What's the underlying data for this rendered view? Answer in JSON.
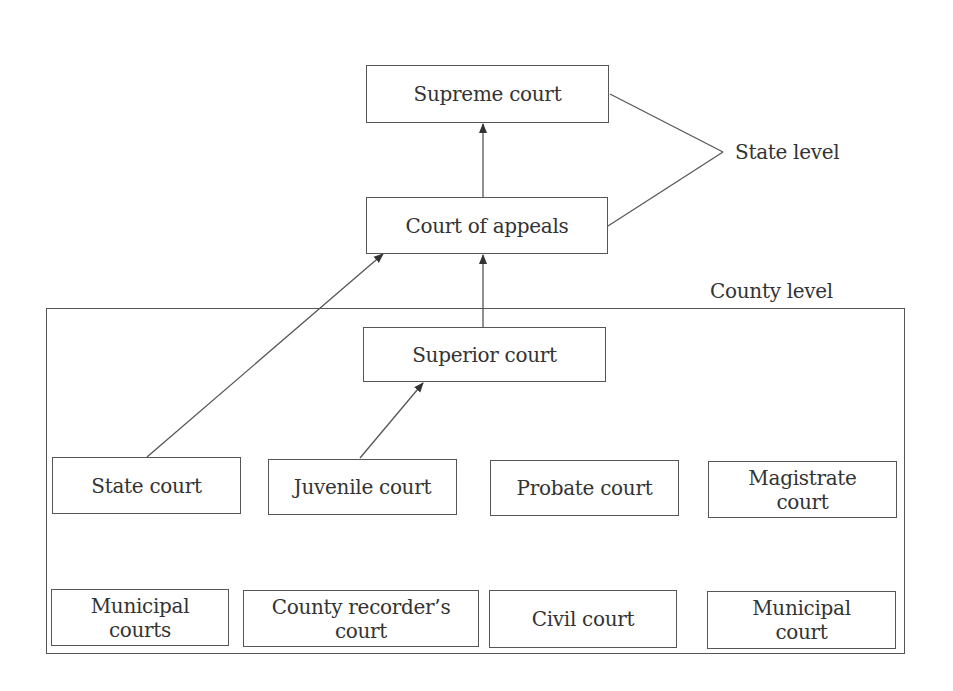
{
  "diagram": {
    "state_level_label": "State level",
    "county_level_label": "County level",
    "state_courts": {
      "supreme": "Supreme court",
      "appeals": "Court of appeals"
    },
    "county_courts": {
      "superior": "Superior court",
      "row1": [
        "State court",
        "Juvenile court",
        "Probate court",
        "Magistrate\ncourt"
      ],
      "row2": [
        "Municipal\ncourts",
        "County recorder’s\ncourt",
        "Civil court",
        "Municipal\ncourt"
      ]
    },
    "edges": [
      {
        "from": "Court of appeals",
        "to": "Supreme court"
      },
      {
        "from": "Superior court",
        "to": "Court of appeals"
      },
      {
        "from": "State court",
        "to": "Court of appeals"
      },
      {
        "from": "Juvenile court",
        "to": "Superior court"
      }
    ],
    "colors": {
      "line": "#555555",
      "text": "#333333",
      "background": "#ffffff"
    }
  }
}
